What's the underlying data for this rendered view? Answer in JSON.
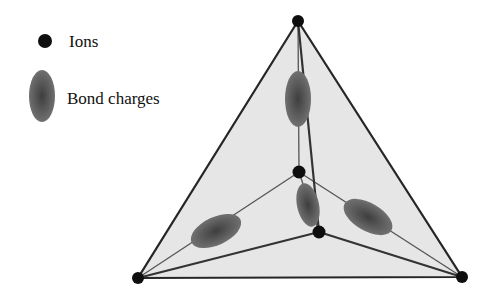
{
  "legend": {
    "ions_label": "Ions",
    "bond_charges_label": "Bond charges"
  },
  "colors": {
    "ion": "#0e0e0e",
    "bond_charge": "#5a5a5a",
    "face_fill": "#e6e6e6",
    "edge": "#262626"
  },
  "structure": {
    "type": "tetrahedral bonding",
    "outer_ions": 4,
    "bond_charges_shown": 4
  }
}
